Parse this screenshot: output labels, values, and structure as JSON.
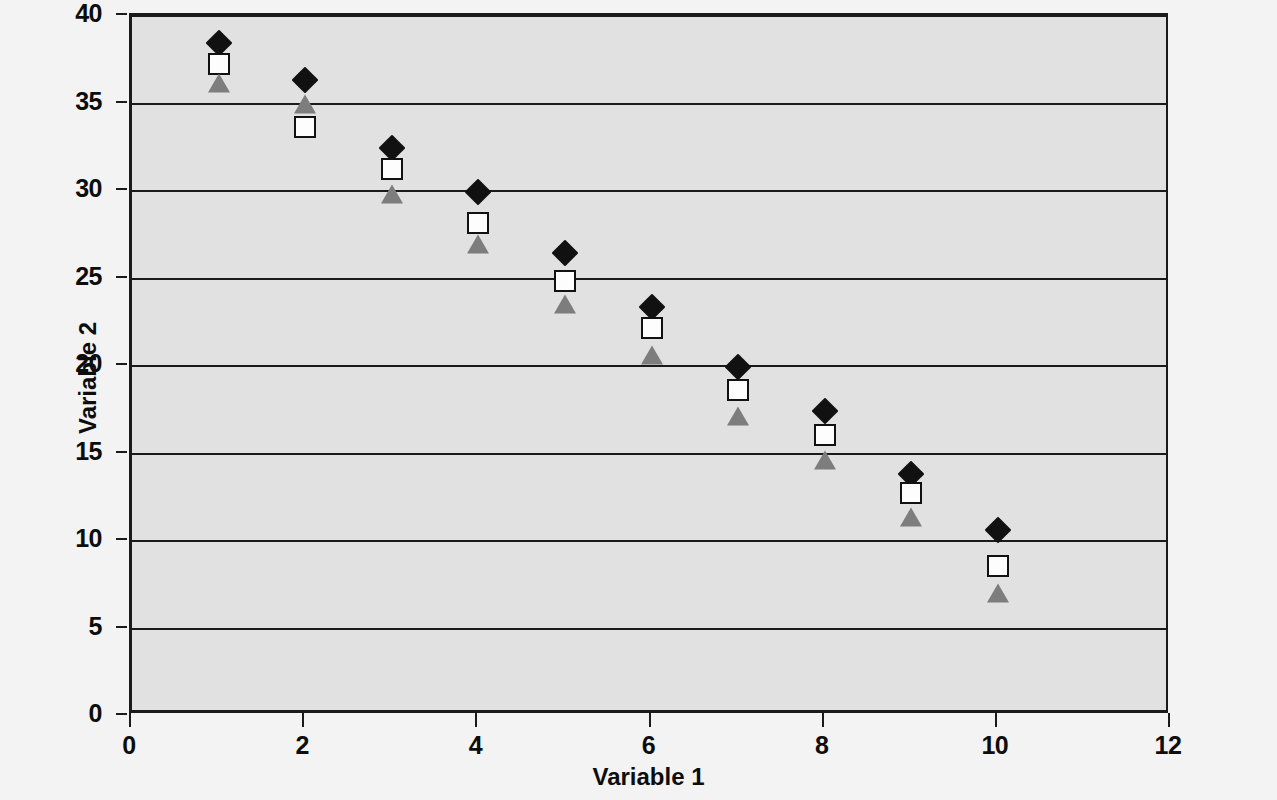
{
  "chart_data": {
    "type": "scatter",
    "title": "",
    "xlabel": "Variable 1",
    "ylabel": "Variable 2",
    "xlim": [
      0,
      12
    ],
    "ylim": [
      0,
      40
    ],
    "xticks": [
      0,
      2,
      4,
      6,
      8,
      10,
      12
    ],
    "yticks": [
      0,
      5,
      10,
      15,
      20,
      25,
      30,
      35,
      40
    ],
    "grid": "horizontal",
    "legend": "none",
    "x": [
      1,
      2,
      3,
      4,
      5,
      6,
      7,
      8,
      9,
      10
    ],
    "series": [
      {
        "name": "Series 1",
        "marker": "diamond",
        "color": "#111111",
        "fill": "solid",
        "values": [
          38.4,
          36.3,
          32.4,
          29.9,
          26.4,
          23.3,
          19.9,
          17.4,
          13.8,
          10.6
        ]
      },
      {
        "name": "Series 2",
        "marker": "square",
        "color": "#111111",
        "fill": "open",
        "values": [
          37.2,
          33.6,
          31.2,
          28.1,
          24.8,
          22.1,
          18.6,
          16.0,
          12.7,
          8.5
        ]
      },
      {
        "name": "Series 3",
        "marker": "triangle",
        "color": "#7d7d7d",
        "fill": "solid",
        "values": [
          36.1,
          34.9,
          29.8,
          26.9,
          23.5,
          20.6,
          17.1,
          14.6,
          11.3,
          7.0
        ]
      }
    ]
  },
  "axes": {
    "y_tick_labels": [
      "0",
      "5",
      "10",
      "15",
      "20",
      "25",
      "30",
      "35",
      "40"
    ],
    "x_tick_labels": [
      "0",
      "2",
      "4",
      "6",
      "8",
      "10",
      "12"
    ],
    "y_axis_title": "Variable 2",
    "x_axis_title": "Variable 1"
  },
  "colors": {
    "page_background": "#f3f3f3",
    "plot_background": "#e1e1e1",
    "axis": "#1a1a1a",
    "series1": "#111111",
    "series2": "#ffffff",
    "series3": "#7d7d7d"
  }
}
